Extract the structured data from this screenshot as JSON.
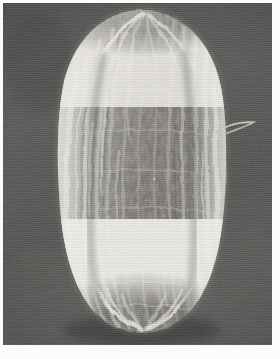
{
  "document": {
    "kind": "scientific-figure",
    "medium": "scanning electron micrograph",
    "caption": "",
    "background_color": "#fbfbfa"
  },
  "plate": {
    "name": "photographic-plate",
    "x": 3,
    "y": 3,
    "width": 269,
    "height": 342,
    "background_color": "#4d4d4d",
    "background_color_light": "#5a5a5a",
    "background_color_dark": "#3f3f3f",
    "grain": "halftone-print-noise",
    "banding": "horizontal-scan-lines"
  },
  "specimen": {
    "name": "ovoid-specimen",
    "description": "ovoid body with longitudinal ridged reticulate surface",
    "orientation": "vertical",
    "bounds": {
      "left": 54,
      "top": 7,
      "right": 223,
      "bottom": 329
    },
    "center_x": 139,
    "center_y": 168,
    "radius_x": 85,
    "radius_y": 161,
    "colors": {
      "rim_highlight": "#eceae4",
      "rim_mid": "#cfcdc7",
      "body_light": "#b4b2ab",
      "body_mid": "#8e8c86",
      "body_dark": "#6e6c67",
      "core_shadow": "#5d5b57",
      "ridge_highlight": "#e4e2db",
      "ridge_shadow": "#605e59"
    },
    "features": {
      "apex": "rounded, ridges converge toward top",
      "base": "broadly rounded with bright basal rim",
      "left_rim": "brightest specular highlight",
      "right_rim": "bright but narrower highlight",
      "interior": "darker central field, coarse reticulate texture"
    },
    "ridge_count": 16
  },
  "filament": {
    "name": "filament-protrusion",
    "description": "thin hair-like filament extending to the right of the specimen",
    "x_start": 216,
    "y_start": 126,
    "x_end": 254,
    "y_end": 122,
    "color": "#b9b7b1"
  }
}
